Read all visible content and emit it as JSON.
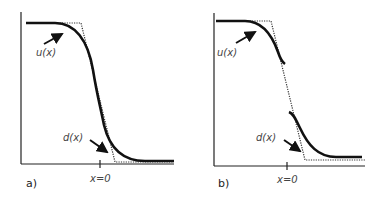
{
  "figure": {
    "panels": [
      {
        "id": "a",
        "label": "a)",
        "curve_u_label": "u(x)",
        "curve_d_label": "d(x)",
        "x_tick_label": "x=0",
        "description": "smooth sigmoid u(x) following step-ramp d(x)"
      },
      {
        "id": "b",
        "label": "b)",
        "curve_u_label": "u(x)",
        "curve_d_label": "d(x)",
        "x_tick_label": "x=0",
        "description": "u(x) with a break around the steep part of d(x)"
      }
    ],
    "colors": {
      "curve": "#111111",
      "dotted": "#333333",
      "axis": "#222222",
      "text": "#444444"
    }
  }
}
